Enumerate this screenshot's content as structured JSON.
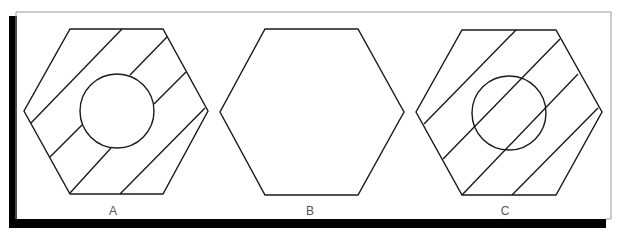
{
  "figure": {
    "panels": [
      {
        "label": "A",
        "shape": "hexagon",
        "has_circle": true,
        "hatching": "interrupted-by-circle"
      },
      {
        "label": "B",
        "shape": "hexagon",
        "has_circle": false,
        "hatching": "none"
      },
      {
        "label": "C",
        "shape": "hexagon",
        "has_circle": true,
        "hatching": "continuous-through-circle"
      }
    ]
  },
  "colors": {
    "line": "#1a1a1a",
    "shadow": "#000000",
    "frame": "#9a9a9a",
    "background": "#ffffff"
  }
}
